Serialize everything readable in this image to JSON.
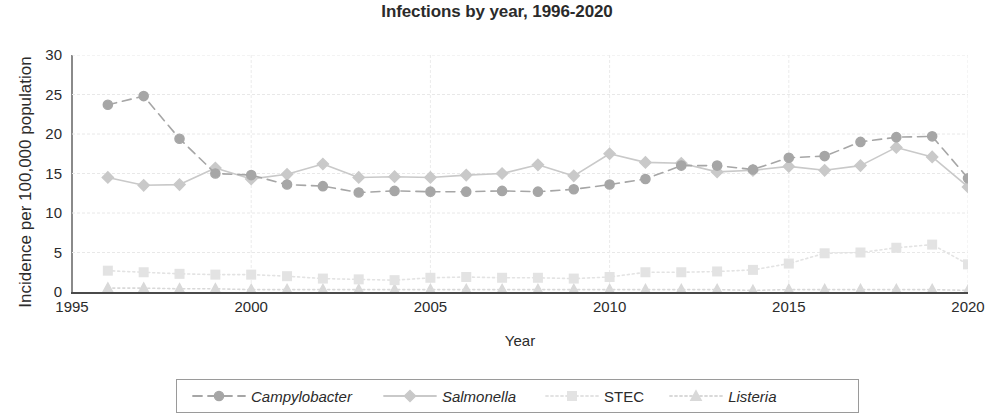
{
  "chart_data": {
    "type": "line",
    "title": "Infections by year, 1996-2020",
    "xlabel": "Year",
    "ylabel": "Incidence per 100,000 population",
    "xlim": [
      1995,
      2020
    ],
    "ylim": [
      0,
      30
    ],
    "xticks": [
      "1995",
      "2000",
      "2005",
      "2010",
      "2015",
      "2020"
    ],
    "yticks": [
      "0",
      "5",
      "10",
      "15",
      "20",
      "25",
      "30"
    ],
    "grid": true,
    "legend_position": "bottom",
    "x": [
      1996,
      1997,
      1998,
      1999,
      2000,
      2001,
      2002,
      2003,
      2004,
      2005,
      2006,
      2007,
      2008,
      2009,
      2010,
      2011,
      2012,
      2013,
      2014,
      2015,
      2016,
      2017,
      2018,
      2019,
      2020
    ],
    "series": [
      {
        "name": "Campylobacter",
        "color": "#a6a6a6",
        "marker": "circle",
        "line_style": "dashed",
        "values": [
          23.7,
          24.8,
          19.4,
          15.0,
          14.8,
          13.6,
          13.4,
          12.6,
          12.8,
          12.7,
          12.7,
          12.8,
          12.7,
          13.0,
          13.6,
          14.3,
          16.0,
          16.0,
          15.5,
          17.0,
          17.2,
          19.0,
          19.6,
          19.7,
          14.4
        ]
      },
      {
        "name": "Salmonella",
        "color": "#c9c9c9",
        "marker": "diamond",
        "line_style": "solid",
        "values": [
          14.5,
          13.5,
          13.6,
          15.7,
          14.3,
          14.9,
          16.2,
          14.5,
          14.6,
          14.5,
          14.8,
          15.0,
          16.1,
          14.7,
          17.5,
          16.4,
          16.3,
          15.2,
          15.4,
          15.9,
          15.4,
          16.0,
          18.3,
          17.1,
          13.3
        ]
      },
      {
        "name": "STEC",
        "color": "#e3e3e3",
        "marker": "square",
        "line_style": "dotted",
        "values": [
          2.7,
          2.5,
          2.3,
          2.2,
          2.2,
          2.0,
          1.7,
          1.6,
          1.5,
          1.8,
          1.9,
          1.8,
          1.8,
          1.7,
          1.9,
          2.5,
          2.5,
          2.6,
          2.8,
          3.6,
          4.9,
          5.0,
          5.6,
          6.0,
          3.5
        ]
      },
      {
        "name": "Listeria",
        "color": "#d9d9d9",
        "marker": "triangle",
        "line_style": "dotted",
        "values": [
          0.5,
          0.5,
          0.4,
          0.4,
          0.3,
          0.3,
          0.3,
          0.3,
          0.3,
          0.3,
          0.3,
          0.3,
          0.3,
          0.3,
          0.3,
          0.3,
          0.3,
          0.3,
          0.2,
          0.3,
          0.3,
          0.3,
          0.3,
          0.3,
          0.2
        ]
      }
    ]
  },
  "legend": {
    "items": [
      {
        "label": "Campylobacter"
      },
      {
        "label": "Salmonella"
      },
      {
        "label": "STEC"
      },
      {
        "label": "Listeria"
      }
    ]
  }
}
